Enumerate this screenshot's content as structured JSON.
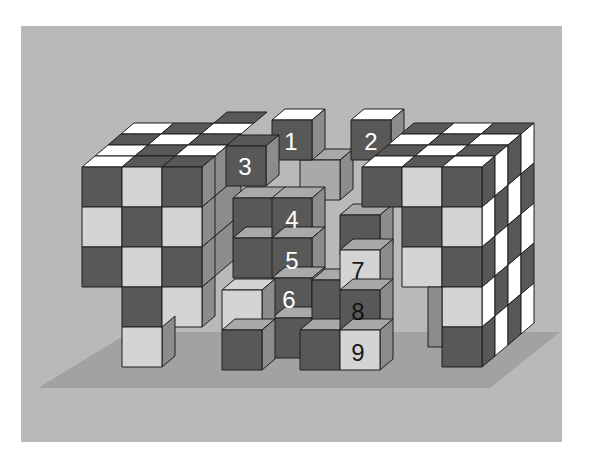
{
  "figure": {
    "numbered_cubes": [
      {
        "label": "1",
        "face_color": "#5a5a5a",
        "text_color": "#ffffff"
      },
      {
        "label": "2",
        "face_color": "#5a5a5a",
        "text_color": "#ffffff"
      },
      {
        "label": "3",
        "face_color": "#5a5a5a",
        "text_color": "#ffffff"
      },
      {
        "label": "4",
        "face_color": "#5a5a5a",
        "text_color": "#ffffff"
      },
      {
        "label": "5",
        "face_color": "#5a5a5a",
        "text_color": "#ffffff"
      },
      {
        "label": "6",
        "face_color": "#5a5a5a",
        "text_color": "#ffffff"
      },
      {
        "label": "7",
        "face_color": "#d4d4d4",
        "text_color": "#1a1a1a"
      },
      {
        "label": "8",
        "face_color": "#4a4a4a",
        "text_color": "#111111"
      },
      {
        "label": "9",
        "face_color": "#d4d4d4",
        "text_color": "#1a1a1a"
      }
    ]
  },
  "colors": {
    "background": "#ffffff",
    "panel": "#b9b9b9",
    "shadow": "#9e9e9e",
    "dark": "#585858",
    "light": "#d4d4d4",
    "white": "#ffffff",
    "side": "#8c8c8c",
    "top_mid": "#a9a9a9",
    "edge": "#1e1e1e"
  }
}
